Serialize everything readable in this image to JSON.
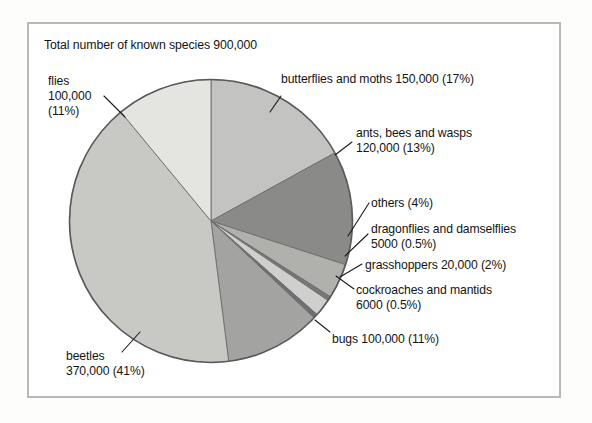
{
  "chart_data": {
    "type": "pie",
    "title": "Total number of known species 900,000",
    "total_label": "900,000",
    "total_value": 900000,
    "xlabel": "",
    "ylabel": "",
    "grid": false,
    "legend_position": "callout-labels",
    "categories": [
      "butterflies and moths",
      "ants, bees and wasps",
      "others",
      "dragonflies and damselflies",
      "grasshoppers",
      "cockroaches and mantids",
      "bugs",
      "beetles",
      "flies"
    ],
    "values": [
      150000,
      120000,
      36000,
      5000,
      20000,
      6000,
      100000,
      370000,
      100000
    ],
    "percentages": [
      17,
      13,
      4,
      0.5,
      2,
      0.5,
      11,
      41,
      11
    ],
    "slices": [
      {
        "name": "butterflies and moths",
        "value": 150000,
        "value_label": "150,000",
        "percent": 17,
        "percent_label": "(17%)",
        "color": "#c3c3c1",
        "label_lines": [
          "butterflies and moths 150,000 (17%)"
        ]
      },
      {
        "name": "ants, bees and wasps",
        "value": 120000,
        "value_label": "120,000",
        "percent": 13,
        "percent_label": "(13%)",
        "color": "#8a8a88",
        "label_lines": [
          "ants, bees and wasps",
          "120,000 (13%)"
        ]
      },
      {
        "name": "others",
        "value": 36000,
        "value_label": "",
        "percent": 4,
        "percent_label": "(4%)",
        "color": "#b0b0ad",
        "label_lines": [
          "others (4%)"
        ]
      },
      {
        "name": "dragonflies and damselflies",
        "value": 5000,
        "value_label": "5000",
        "percent": 0.5,
        "percent_label": "(0.5%)",
        "color": "#77777a",
        "label_lines": [
          "dragonflies and damselflies",
          "5000 (0.5%)"
        ]
      },
      {
        "name": "grasshoppers",
        "value": 20000,
        "value_label": "20,000",
        "percent": 2,
        "percent_label": "(2%)",
        "color": "#cfcfcd",
        "label_lines": [
          "grasshoppers 20,000 (2%)"
        ]
      },
      {
        "name": "cockroaches and mantids",
        "value": 6000,
        "value_label": "6000",
        "percent": 0.5,
        "percent_label": "(0.5%)",
        "color": "#6f6f72",
        "label_lines": [
          "cockroaches and mantids",
          "6000 (0.5%)"
        ]
      },
      {
        "name": "bugs",
        "value": 100000,
        "value_label": "100,000",
        "percent": 11,
        "percent_label": "(11%)",
        "color": "#a3a3a1",
        "label_lines": [
          "bugs 100,000 (11%)"
        ]
      },
      {
        "name": "beetles",
        "value": 370000,
        "value_label": "370,000",
        "percent": 41,
        "percent_label": "(41%)",
        "color": "#c8c8c5",
        "label_lines": [
          "beetles",
          "370,000 (41%)"
        ]
      },
      {
        "name": "flies",
        "value": 100000,
        "value_label": "100,000",
        "percent": 11,
        "percent_label": "(11%)",
        "color": "#e4e4e1",
        "label_lines": [
          "flies",
          "100,000",
          "(11%)"
        ]
      }
    ]
  },
  "figure": {
    "title": "Total number of known species 900,000",
    "frame_color": "#b9b9b6",
    "background": "#ffffff",
    "outline_color": "#555555",
    "text_color": "#141414"
  },
  "labels": {
    "flies_l1": "flies",
    "flies_l2": "100,000",
    "flies_l3": "(11%)",
    "butterflies_l1": "butterflies and moths 150,000 (17%)",
    "ants_l1": "ants, bees and wasps",
    "ants_l2": "120,000 (13%)",
    "others_l1": "others (4%)",
    "dragonflies_l1": "dragonflies and damselflies",
    "dragonflies_l2": "5000 (0.5%)",
    "grasshoppers_l1": "grasshoppers 20,000 (2%)",
    "cockroaches_l1": "cockroaches and mantids",
    "cockroaches_l2": "6000 (0.5%)",
    "bugs_l1": "bugs 100,000 (11%)",
    "beetles_l1": "beetles",
    "beetles_l2": "370,000 (41%)"
  }
}
